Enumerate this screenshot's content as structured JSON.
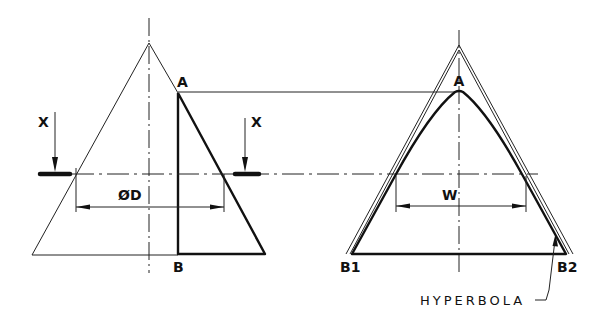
{
  "figure": {
    "stroke_color": "#111111",
    "background_color": "#ffffff"
  },
  "left_view": {
    "apex_label": "A",
    "base_label": "B",
    "section_arrow_left_label": "X",
    "section_arrow_right_label": "X",
    "dimension_label": "ØD"
  },
  "right_view": {
    "apex_label": "A",
    "base_left_label": "B1",
    "base_right_label": "B2",
    "dimension_label": "W",
    "curve_label": "HYPERBOLA"
  }
}
